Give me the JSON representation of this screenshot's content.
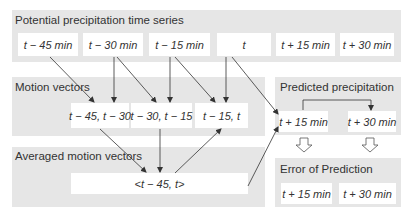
{
  "panels": {
    "series": {
      "title": "Potential precipitation time series",
      "boxes": [
        "t − 45 min",
        "t − 30 min",
        "t − 15 min",
        "t",
        "t + 15 min",
        "t + 30 min"
      ]
    },
    "motion": {
      "title": "Motion vectors",
      "boxes": [
        "t − 45, t − 30",
        "t − 30, t − 15",
        "t − 15, t"
      ]
    },
    "averaged": {
      "title": "Averaged motion vectors",
      "boxes": [
        "<t − 45, t>"
      ]
    },
    "predicted": {
      "title": "Predicted precipitation",
      "boxes": [
        "t + 15 min",
        "t + 30 min"
      ]
    },
    "error": {
      "title": "Error of Prediction",
      "boxes": [
        "t + 15 min",
        "t + 30 min"
      ]
    }
  },
  "colors": {
    "panel_bg": "#e6e6e6",
    "box_bg": "#ffffff",
    "line": "#333333"
  }
}
